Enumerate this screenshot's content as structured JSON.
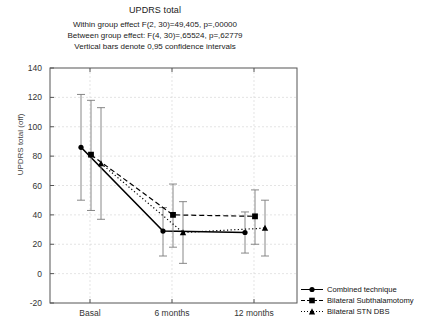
{
  "chart_data": {
    "type": "line",
    "title": "UPDRS total",
    "subtitle": [
      "Within group  effect F(2, 30)=49,405, p=,00000",
      "Between group effect: F(4, 30)=,65524, p=,62779",
      "Vertical bars denote 0,95 confidence intervals"
    ],
    "xlabel": "",
    "ylabel": "UPDRS total (off)",
    "categories": [
      "Basal",
      "6 months",
      "12 months"
    ],
    "ylim": [
      -20,
      140
    ],
    "yticks": [
      140,
      120,
      100,
      80,
      60,
      40,
      20,
      0,
      -20
    ],
    "grid": true,
    "legend_position": "right",
    "series": [
      {
        "name": "Combined technique",
        "marker": "circle",
        "line": "solid",
        "color": "#000000",
        "values": [
          86,
          29,
          28
        ],
        "ci_low": [
          50,
          12,
          14
        ],
        "ci_high": [
          122,
          45,
          42
        ]
      },
      {
        "name": "Bilateral Subthalamotomy",
        "marker": "square",
        "line": "dashed",
        "color": "#000000",
        "values": [
          81,
          40,
          39
        ],
        "ci_low": [
          43,
          18,
          20
        ],
        "ci_high": [
          118,
          61,
          57
        ]
      },
      {
        "name": "Bilateral STN DBS",
        "marker": "triangle",
        "line": "dotted",
        "color": "#000000",
        "values": [
          75,
          28,
          31
        ],
        "ci_low": [
          37,
          7,
          12
        ],
        "ci_high": [
          113,
          49,
          50
        ]
      }
    ]
  },
  "axis": {
    "yticks": [
      "140",
      "120",
      "100",
      "80",
      "60",
      "40",
      "20",
      "0",
      "-20"
    ],
    "xticks": [
      "Basal",
      "6 months",
      "12 months"
    ],
    "ylabel": "UPDRS total (off)"
  },
  "legend": {
    "items": [
      {
        "label": "Combined technique",
        "icon": "circle-marker-icon"
      },
      {
        "label": "Bilateral Subthalamotomy",
        "icon": "square-marker-icon"
      },
      {
        "label": "Bilateral STN DBS",
        "icon": "triangle-marker-icon"
      }
    ]
  }
}
